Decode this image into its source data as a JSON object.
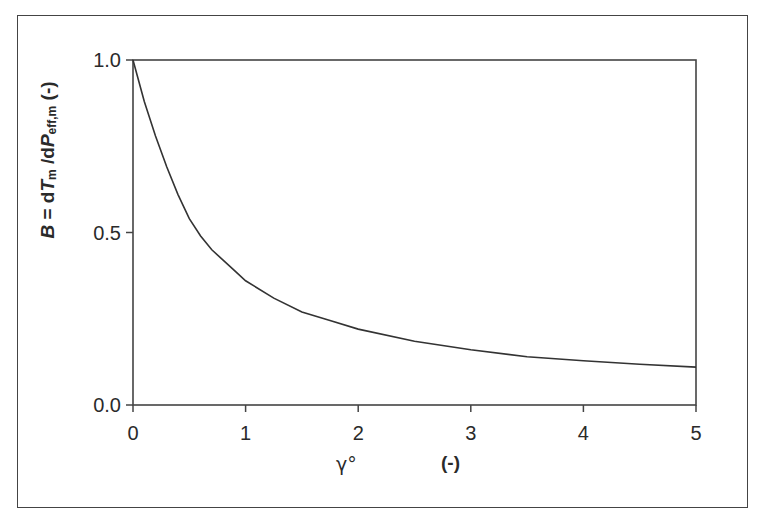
{
  "chart_data": {
    "type": "line",
    "title": "",
    "xlabel": "γ°",
    "xlabel_unit": "(-)",
    "ylabel": "B = dTm /dPeff,m (-)",
    "ylabel_parts": {
      "B": "B",
      "eq": " = d",
      "T": "T",
      "T_sub": "m",
      "slash": " /d",
      "P": "P",
      "P_sub": "eff,m",
      "unit": " (-)"
    },
    "xlim": [
      0,
      5
    ],
    "ylim": [
      0,
      1
    ],
    "x_ticks": [
      "0",
      "1",
      "2",
      "3",
      "4",
      "5"
    ],
    "y_ticks": [
      "0.0",
      "0.5",
      "1.0"
    ],
    "grid": false,
    "legend": null,
    "series": [
      {
        "name": "B",
        "x": [
          0,
          0.1,
          0.2,
          0.3,
          0.4,
          0.5,
          0.6,
          0.7,
          0.8,
          0.9,
          1.0,
          1.25,
          1.5,
          1.75,
          2.0,
          2.5,
          3.0,
          3.5,
          4.0,
          4.5,
          5.0
        ],
        "values": [
          1.0,
          0.88,
          0.78,
          0.69,
          0.61,
          0.54,
          0.49,
          0.45,
          0.42,
          0.39,
          0.36,
          0.31,
          0.27,
          0.245,
          0.22,
          0.185,
          0.16,
          0.14,
          0.128,
          0.118,
          0.11
        ]
      }
    ]
  }
}
